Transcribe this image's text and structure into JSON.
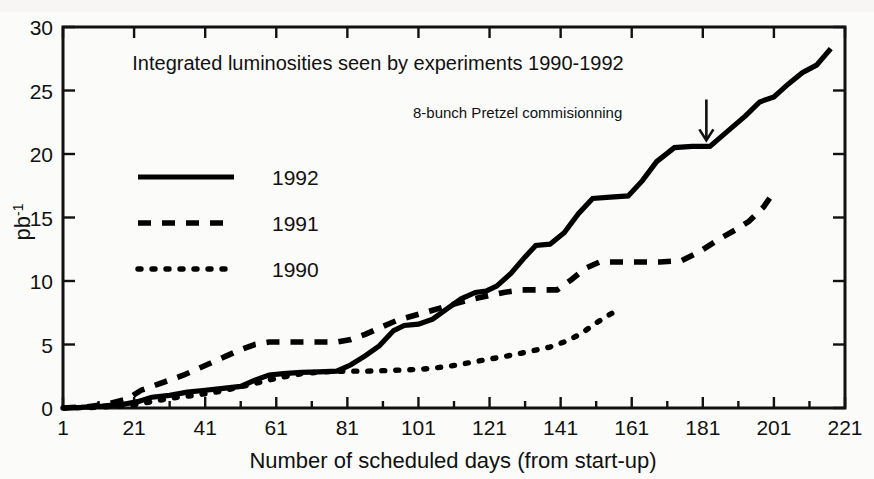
{
  "chart_data": {
    "type": "line",
    "title": "Integrated luminosities seen by experiments 1990-1992",
    "xlabel": "Number of scheduled days (from start-up)",
    "ylabel": "pb",
    "ylabel_sup": "-1",
    "xlim": [
      1,
      221
    ],
    "ylim": [
      0,
      30
    ],
    "xticks": [
      1,
      21,
      41,
      61,
      81,
      101,
      121,
      141,
      161,
      181,
      201,
      221
    ],
    "xtick_labels": [
      "1",
      "21",
      "41",
      "61",
      "81",
      "101",
      "121",
      "141",
      "161",
      "181",
      "201",
      "221"
    ],
    "yticks": [
      0,
      5,
      10,
      15,
      20,
      25,
      30
    ],
    "ytick_labels": [
      "0",
      "5",
      "10",
      "15",
      "20",
      "25",
      "30"
    ],
    "xtick_minor_step": 10,
    "grid": false,
    "legend_position": "upper-left-inside",
    "annotations": [
      {
        "text": "8-bunch Pretzel commisionning",
        "marker": "down-arrow",
        "points_to_x": 182,
        "points_to_y": 20.6
      }
    ],
    "series": [
      {
        "name": "1992",
        "style": "solid",
        "color": "#000000",
        "points": [
          [
            1,
            0.0
          ],
          [
            6,
            0.05
          ],
          [
            12,
            0.15
          ],
          [
            18,
            0.3
          ],
          [
            22,
            0.5
          ],
          [
            26,
            0.85
          ],
          [
            31,
            1.0
          ],
          [
            36,
            1.25
          ],
          [
            41,
            1.4
          ],
          [
            46,
            1.55
          ],
          [
            51,
            1.7
          ],
          [
            55,
            2.2
          ],
          [
            59,
            2.6
          ],
          [
            63,
            2.7
          ],
          [
            68,
            2.8
          ],
          [
            73,
            2.85
          ],
          [
            78,
            2.9
          ],
          [
            82,
            3.4
          ],
          [
            86,
            4.1
          ],
          [
            90,
            4.9
          ],
          [
            94,
            6.1
          ],
          [
            97,
            6.5
          ],
          [
            101,
            6.6
          ],
          [
            105,
            7.0
          ],
          [
            109,
            7.8
          ],
          [
            113,
            8.6
          ],
          [
            117,
            9.1
          ],
          [
            120,
            9.2
          ],
          [
            123,
            9.6
          ],
          [
            127,
            10.6
          ],
          [
            131,
            11.9
          ],
          [
            134,
            12.8
          ],
          [
            138,
            12.9
          ],
          [
            142,
            13.8
          ],
          [
            146,
            15.3
          ],
          [
            150,
            16.5
          ],
          [
            155,
            16.6
          ],
          [
            160,
            16.7
          ],
          [
            164,
            17.9
          ],
          [
            168,
            19.4
          ],
          [
            173,
            20.5
          ],
          [
            178,
            20.6
          ],
          [
            183,
            20.6
          ],
          [
            188,
            21.8
          ],
          [
            193,
            23.0
          ],
          [
            197,
            24.1
          ],
          [
            201,
            24.5
          ],
          [
            205,
            25.5
          ],
          [
            209,
            26.4
          ],
          [
            213,
            27.0
          ],
          [
            217,
            28.3
          ]
        ]
      },
      {
        "name": "1991",
        "style": "dashed",
        "color": "#000000",
        "points": [
          [
            1,
            0.0
          ],
          [
            8,
            0.1
          ],
          [
            14,
            0.35
          ],
          [
            19,
            0.7
          ],
          [
            23,
            1.4
          ],
          [
            27,
            1.8
          ],
          [
            31,
            2.2
          ],
          [
            35,
            2.6
          ],
          [
            39,
            3.1
          ],
          [
            43,
            3.6
          ],
          [
            47,
            4.1
          ],
          [
            51,
            4.6
          ],
          [
            55,
            5.0
          ],
          [
            59,
            5.2
          ],
          [
            63,
            5.2
          ],
          [
            68,
            5.2
          ],
          [
            73,
            5.2
          ],
          [
            78,
            5.2
          ],
          [
            82,
            5.4
          ],
          [
            86,
            5.8
          ],
          [
            90,
            6.3
          ],
          [
            95,
            6.9
          ],
          [
            100,
            7.3
          ],
          [
            105,
            7.7
          ],
          [
            110,
            8.1
          ],
          [
            115,
            8.5
          ],
          [
            120,
            8.8
          ],
          [
            125,
            9.1
          ],
          [
            130,
            9.3
          ],
          [
            135,
            9.3
          ],
          [
            140,
            9.3
          ],
          [
            144,
            10.1
          ],
          [
            148,
            11.0
          ],
          [
            152,
            11.5
          ],
          [
            157,
            11.5
          ],
          [
            163,
            11.5
          ],
          [
            169,
            11.5
          ],
          [
            175,
            11.6
          ],
          [
            180,
            12.3
          ],
          [
            185,
            13.2
          ],
          [
            190,
            14.0
          ],
          [
            194,
            14.7
          ],
          [
            198,
            15.8
          ],
          [
            201,
            17.0
          ]
        ]
      },
      {
        "name": "1990",
        "style": "dotted",
        "color": "#000000",
        "points": [
          [
            1,
            0.0
          ],
          [
            10,
            0.05
          ],
          [
            20,
            0.2
          ],
          [
            26,
            0.5
          ],
          [
            32,
            0.8
          ],
          [
            38,
            1.0
          ],
          [
            44,
            1.25
          ],
          [
            50,
            1.6
          ],
          [
            56,
            2.0
          ],
          [
            62,
            2.4
          ],
          [
            68,
            2.7
          ],
          [
            74,
            2.85
          ],
          [
            80,
            2.9
          ],
          [
            86,
            2.9
          ],
          [
            92,
            2.95
          ],
          [
            98,
            3.0
          ],
          [
            104,
            3.1
          ],
          [
            110,
            3.3
          ],
          [
            116,
            3.6
          ],
          [
            122,
            3.9
          ],
          [
            128,
            4.2
          ],
          [
            133,
            4.5
          ],
          [
            138,
            4.8
          ],
          [
            143,
            5.3
          ],
          [
            147,
            5.9
          ],
          [
            151,
            6.7
          ],
          [
            155,
            7.4
          ],
          [
            158,
            7.8
          ]
        ]
      }
    ]
  },
  "legend": {
    "entries": [
      {
        "label": "1992",
        "style": "solid"
      },
      {
        "label": "1991",
        "style": "dashed"
      },
      {
        "label": "1990",
        "style": "dotted"
      }
    ]
  }
}
